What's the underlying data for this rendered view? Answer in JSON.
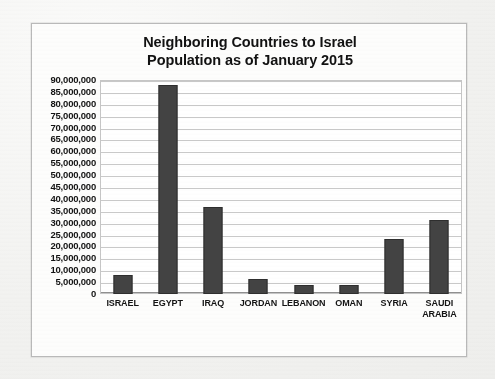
{
  "chart_data": {
    "type": "bar",
    "title": "Neighboring Countries to Israel Population as of January 2015",
    "title_lines": [
      "Neighboring Countries to Israel",
      "Population as of January 2015"
    ],
    "categories": [
      "ISRAEL",
      "EGYPT",
      "IRAQ",
      "JORDAN",
      "LEBANON",
      "OMAN",
      "SYRIA",
      "SAUDI ARABIA"
    ],
    "category_lines": [
      [
        "ISRAEL"
      ],
      [
        "EGYPT"
      ],
      [
        "IRAQ"
      ],
      [
        "JORDAN"
      ],
      [
        "LEBANON"
      ],
      [
        "OMAN"
      ],
      [
        "SYRIA"
      ],
      [
        "SAUDI",
        "ARABIA"
      ]
    ],
    "values": [
      8000000,
      88000000,
      36500000,
      6500000,
      4000000,
      4000000,
      23000000,
      31000000
    ],
    "xlabel": "",
    "ylabel": "",
    "ylim": [
      0,
      90000000
    ],
    "ytick_step": 5000000,
    "ytick_labels": [
      "90,000,000",
      "85,000,000",
      "80,000,000",
      "75,000,000",
      "70,000,000",
      "65,000,000",
      "60,000,000",
      "55,000,000",
      "50,000,000",
      "45,000,000",
      "40,000,000",
      "35,000,000",
      "30,000,000",
      "25,000,000",
      "20,000,000",
      "15,000,000",
      "10,000,000",
      "5,000,000",
      "0"
    ],
    "ytick_values": [
      90000000,
      85000000,
      80000000,
      75000000,
      70000000,
      65000000,
      60000000,
      55000000,
      50000000,
      45000000,
      40000000,
      35000000,
      30000000,
      25000000,
      20000000,
      15000000,
      10000000,
      5000000,
      0
    ],
    "grid": true,
    "legend": false,
    "legend_position": "none",
    "series": [
      {
        "name": "Population",
        "values": [
          8000000,
          88000000,
          36500000,
          6500000,
          4000000,
          4000000,
          23000000,
          31000000
        ]
      }
    ]
  },
  "colors": {
    "bar_fill": "#434343",
    "bar_border": "#2e2e2e",
    "gridline": "#c9c9c9",
    "plot_background": "#ffffff",
    "frame_border": "#b9b9b9",
    "page_background": "#f3f3f1",
    "text": "#141414"
  }
}
